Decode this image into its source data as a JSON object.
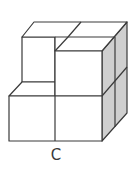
{
  "figure": {
    "label": "C",
    "colors": {
      "stroke": "#3a3a3a",
      "face": "#ffffff",
      "side_shade": "#cfcfcf"
    }
  }
}
